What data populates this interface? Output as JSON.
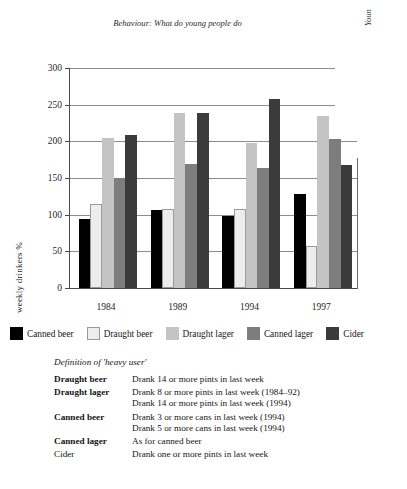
{
  "page": {
    "running_head": "Behaviour: What do young people do",
    "running_head_side": "Youn"
  },
  "chart_data": {
    "type": "bar",
    "title": "",
    "xlabel": "",
    "ylabel": "weekly drinkers %",
    "ylim": [
      0,
      300
    ],
    "yticks": [
      0,
      50,
      100,
      150,
      200,
      250,
      300
    ],
    "ytick_labels": [
      "0",
      "50",
      "100",
      "150",
      "200",
      "250",
      "300"
    ],
    "categories": [
      "1984",
      "1989",
      "1994",
      "1997"
    ],
    "grid": true,
    "legend_position": "below",
    "series": [
      {
        "name": "Canned beer",
        "color": "#000000",
        "values": [
          94,
          106,
          98,
          128
        ]
      },
      {
        "name": "Draught beer",
        "color": "#ededed",
        "values": [
          114,
          108,
          108,
          57
        ]
      },
      {
        "name": "Draught lager",
        "color": "#c4c4c4",
        "values": [
          204,
          239,
          198,
          235
        ]
      },
      {
        "name": "Canned lager",
        "color": "#7d7d7d",
        "values": [
          150,
          169,
          164,
          203
        ]
      },
      {
        "name": "Cider",
        "color": "#3b3b3b",
        "values": [
          209,
          238,
          258,
          168
        ]
      }
    ]
  },
  "definitions": {
    "title": "Definition of 'heavy user'",
    "rows": [
      {
        "term": "Draught beer",
        "bold": true,
        "lines": [
          "Drank 14 or more pints in last week"
        ]
      },
      {
        "term": "Draught lager",
        "bold": true,
        "lines": [
          "Drank 8 or more pints in last week (1984–92)",
          "Drank 14 or more pints in last week (1994)"
        ]
      },
      {
        "term": "Canned beer",
        "bold": true,
        "lines": [
          "Drank 3 or more cans in last week (1994)",
          "Drank 5 or more cans in last week (1994)"
        ]
      },
      {
        "term": "Canned lager",
        "bold": true,
        "lines": [
          "As for canned beer"
        ]
      },
      {
        "term": "Cider",
        "bold": false,
        "lines": [
          "Drank one or more pints in last week"
        ]
      }
    ]
  }
}
